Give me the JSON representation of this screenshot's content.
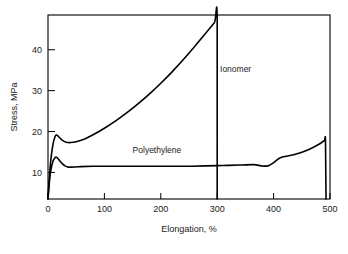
{
  "chart_data": {
    "type": "line",
    "title": "",
    "xlabel": "Elongation, %",
    "ylabel": "Stress, MPa",
    "xlim": [
      0,
      500
    ],
    "ylim": [
      3.5,
      48.5
    ],
    "xticks": [
      0,
      100,
      200,
      300,
      400,
      500
    ],
    "yticks": [
      10,
      20,
      30,
      40
    ],
    "xtick_labels": [
      "0",
      "100",
      "200",
      "300",
      "400",
      "500"
    ],
    "ytick_labels": [
      "10",
      "20",
      "30",
      "40"
    ],
    "grid": false,
    "legend_position": "inline-annotations",
    "series": [
      {
        "name": "Ionomer",
        "label": "Ionomer",
        "color": "#000000",
        "points": [
          [
            0,
            3.5
          ],
          [
            2,
            8.0
          ],
          [
            5,
            13.0
          ],
          [
            9,
            17.0
          ],
          [
            13,
            18.9
          ],
          [
            16,
            19.1
          ],
          [
            20,
            18.6
          ],
          [
            25,
            17.9
          ],
          [
            32,
            17.4
          ],
          [
            40,
            17.3
          ],
          [
            50,
            17.5
          ],
          [
            65,
            18.2
          ],
          [
            80,
            19.2
          ],
          [
            100,
            20.8
          ],
          [
            120,
            22.6
          ],
          [
            140,
            24.6
          ],
          [
            160,
            26.8
          ],
          [
            180,
            29.2
          ],
          [
            200,
            31.8
          ],
          [
            220,
            34.6
          ],
          [
            240,
            37.6
          ],
          [
            260,
            40.8
          ],
          [
            280,
            44.1
          ],
          [
            295,
            46.6
          ],
          [
            300,
            47.3
          ],
          [
            300,
            3.5
          ]
        ],
        "fracture_elongation": 300,
        "fracture_stress": 47.3,
        "yield_peak": {
          "elongation": 16,
          "stress": 19.1
        }
      },
      {
        "name": "Polyethylene",
        "label": "Polyethylene",
        "color": "#000000",
        "points": [
          [
            0,
            3.5
          ],
          [
            2,
            7.0
          ],
          [
            5,
            10.5
          ],
          [
            9,
            12.8
          ],
          [
            13,
            13.7
          ],
          [
            16,
            13.6
          ],
          [
            20,
            13.0
          ],
          [
            25,
            12.2
          ],
          [
            30,
            11.6
          ],
          [
            36,
            11.3
          ],
          [
            42,
            11.3
          ],
          [
            55,
            11.4
          ],
          [
            80,
            11.5
          ],
          [
            120,
            11.5
          ],
          [
            160,
            11.5
          ],
          [
            200,
            11.5
          ],
          [
            240,
            11.5
          ],
          [
            280,
            11.6
          ],
          [
            310,
            11.7
          ],
          [
            340,
            11.8
          ],
          [
            365,
            11.9
          ],
          [
            378,
            11.6
          ],
          [
            390,
            11.6
          ],
          [
            400,
            12.4
          ],
          [
            412,
            13.6
          ],
          [
            425,
            14.0
          ],
          [
            440,
            14.5
          ],
          [
            455,
            15.2
          ],
          [
            470,
            16.1
          ],
          [
            482,
            17.0
          ],
          [
            490,
            17.8
          ],
          [
            492,
            17.6
          ],
          [
            493,
            3.5
          ]
        ],
        "fracture_elongation": 493,
        "fracture_stress": 17.8,
        "yield_peak": {
          "elongation": 13,
          "stress": 13.7
        },
        "plateau_stress": 11.5
      }
    ],
    "annotations": [
      {
        "text": "Ionomer",
        "elongation": 305,
        "stress": 34.5
      },
      {
        "text": "Polyethylene",
        "elongation": 150,
        "stress": 14.8
      }
    ]
  }
}
